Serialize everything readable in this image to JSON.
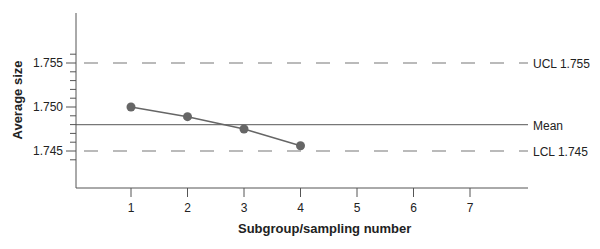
{
  "chart_data": {
    "type": "line",
    "title": "",
    "xlabel": "Subgroup/sampling number",
    "ylabel": "Average size",
    "x": [
      1,
      2,
      3,
      4
    ],
    "series": [
      {
        "name": "Sample averages",
        "values": [
          1.75,
          1.7489,
          1.7475,
          1.7456
        ]
      }
    ],
    "x_ticks": [
      "1",
      "2",
      "3",
      "4",
      "5",
      "6",
      "7"
    ],
    "y_ticks": [
      "1.745",
      "1.750",
      "1.755"
    ],
    "ylim": [
      1.7402,
      1.7608
    ],
    "xlim": [
      0,
      7.7
    ],
    "reference_lines": [
      {
        "label": "UCL 1.755",
        "value": 1.755,
        "style": "dashed"
      },
      {
        "label": "Mean",
        "value": 1.748,
        "style": "solid"
      },
      {
        "label": "LCL 1.745",
        "value": 1.745,
        "style": "dashed"
      }
    ],
    "grid": false,
    "legend": "none"
  }
}
